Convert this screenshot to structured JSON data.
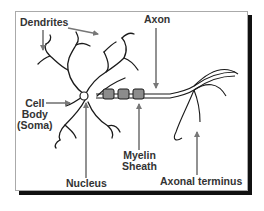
{
  "diagram": {
    "colors": {
      "line": "#1a1a1a",
      "arrow": "#777777",
      "myelin_fill": "#8c8c8c",
      "label": "#333333",
      "frame_border": "#aaaaaa",
      "frame_shadow": "#111111"
    },
    "labels": {
      "dendrites": "Dendrites",
      "axon": "Axon",
      "cell_body_line1": "Cell",
      "cell_body_line2": "Body",
      "cell_body_line3": "(Soma)",
      "myelin_line1": "Myelin",
      "myelin_line2": "Sheath",
      "nucleus": "Nucleus",
      "axonal_terminus": "Axonal terminus"
    },
    "myelin_segments": 3
  }
}
